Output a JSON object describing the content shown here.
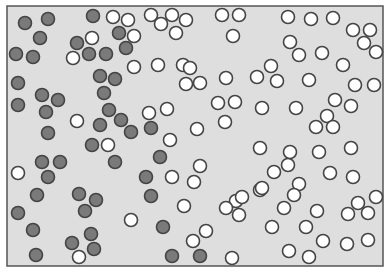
{
  "diagram": {
    "type": "particle-mixing-box",
    "box": {
      "x": 7,
      "y": 6,
      "width": 376,
      "height": 260,
      "fill": "#dedede",
      "stroke": "#555555"
    },
    "particle_radius": 6.5,
    "colors": {
      "dark_fill": "#7a7a7a",
      "light_fill": "#ffffff",
      "stroke": "#444444"
    },
    "dark_particles": [
      [
        25,
        23
      ],
      [
        48,
        19
      ],
      [
        40,
        38
      ],
      [
        16,
        54
      ],
      [
        33,
        57
      ],
      [
        93,
        16
      ],
      [
        119,
        33
      ],
      [
        77,
        43
      ],
      [
        89,
        54
      ],
      [
        106,
        54
      ],
      [
        126,
        48
      ],
      [
        18,
        83
      ],
      [
        100,
        76
      ],
      [
        115,
        79
      ],
      [
        42,
        95
      ],
      [
        58,
        100
      ],
      [
        18,
        105
      ],
      [
        104,
        93
      ],
      [
        46,
        112
      ],
      [
        109,
        110
      ],
      [
        121,
        120
      ],
      [
        100,
        125
      ],
      [
        48,
        133
      ],
      [
        92,
        145
      ],
      [
        131,
        132
      ],
      [
        151,
        128
      ],
      [
        42,
        162
      ],
      [
        60,
        162
      ],
      [
        115,
        162
      ],
      [
        48,
        177
      ],
      [
        37,
        195
      ],
      [
        79,
        194
      ],
      [
        96,
        200
      ],
      [
        85,
        211
      ],
      [
        18,
        213
      ],
      [
        33,
        230
      ],
      [
        91,
        234
      ],
      [
        72,
        243
      ],
      [
        94,
        249
      ],
      [
        36,
        255
      ],
      [
        160,
        157
      ],
      [
        146,
        177
      ],
      [
        151,
        196
      ],
      [
        163,
        227
      ],
      [
        172,
        256
      ],
      [
        200,
        256
      ]
    ],
    "light_particles": [
      [
        113,
        17
      ],
      [
        128,
        20
      ],
      [
        92,
        38
      ],
      [
        134,
        36
      ],
      [
        73,
        58
      ],
      [
        151,
        15
      ],
      [
        172,
        15
      ],
      [
        186,
        20
      ],
      [
        161,
        24
      ],
      [
        176,
        33
      ],
      [
        222,
        15
      ],
      [
        239,
        15
      ],
      [
        233,
        36
      ],
      [
        183,
        65
      ],
      [
        288,
        17
      ],
      [
        311,
        19
      ],
      [
        333,
        18
      ],
      [
        353,
        30
      ],
      [
        370,
        30
      ],
      [
        364,
        43
      ],
      [
        376,
        52
      ],
      [
        290,
        42
      ],
      [
        299,
        55
      ],
      [
        322,
        53
      ],
      [
        343,
        65
      ],
      [
        271,
        66
      ],
      [
        309,
        80
      ],
      [
        335,
        100
      ],
      [
        374,
        85
      ],
      [
        355,
        85
      ],
      [
        134,
        67
      ],
      [
        158,
        65
      ],
      [
        190,
        68
      ],
      [
        186,
        84
      ],
      [
        200,
        83
      ],
      [
        218,
        103
      ],
      [
        226,
        78
      ],
      [
        225,
        122
      ],
      [
        149,
        113
      ],
      [
        167,
        109
      ],
      [
        197,
        129
      ],
      [
        170,
        140
      ],
      [
        108,
        145
      ],
      [
        77,
        121
      ],
      [
        257,
        77
      ],
      [
        277,
        81
      ],
      [
        235,
        102
      ],
      [
        262,
        108
      ],
      [
        296,
        108
      ],
      [
        316,
        127
      ],
      [
        327,
        116
      ],
      [
        333,
        127
      ],
      [
        351,
        148
      ],
      [
        351,
        106
      ],
      [
        260,
        190
      ],
      [
        284,
        208
      ],
      [
        317,
        211
      ],
      [
        358,
        203
      ],
      [
        376,
        197
      ],
      [
        348,
        214
      ],
      [
        368,
        213
      ],
      [
        368,
        240
      ],
      [
        347,
        244
      ],
      [
        323,
        241
      ],
      [
        306,
        227
      ],
      [
        262,
        188
      ],
      [
        236,
        201
      ],
      [
        274,
        172
      ],
      [
        288,
        165
      ],
      [
        299,
        184
      ],
      [
        239,
        215
      ],
      [
        272,
        227
      ],
      [
        309,
        257
      ],
      [
        289,
        251
      ],
      [
        294,
        195
      ],
      [
        330,
        173
      ],
      [
        353,
        177
      ],
      [
        319,
        152
      ],
      [
        290,
        152
      ],
      [
        260,
        148
      ],
      [
        18,
        173
      ],
      [
        79,
        257
      ],
      [
        200,
        166
      ],
      [
        172,
        177
      ],
      [
        194,
        182
      ],
      [
        184,
        206
      ],
      [
        131,
        220
      ],
      [
        206,
        231
      ],
      [
        193,
        241
      ],
      [
        232,
        258
      ],
      [
        242,
        197
      ],
      [
        226,
        208
      ]
    ]
  }
}
